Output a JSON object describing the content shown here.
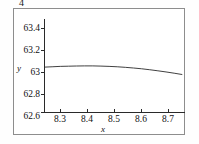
{
  "figure": {
    "number": "4",
    "frame_border_color": "#8d8d8d",
    "background": "#ffffff"
  },
  "chart_data": {
    "type": "line",
    "title": "",
    "subtitle": "",
    "xlabel": "x",
    "ylabel": "y",
    "xlim": [
      8.24,
      8.76
    ],
    "ylim": [
      62.52,
      63.5
    ],
    "xticks": [
      "8.3",
      "8.4",
      "8.5",
      "8.6",
      "8.7"
    ],
    "xtick_values": [
      8.3,
      8.4,
      8.5,
      8.6,
      8.7
    ],
    "yticks": [
      "63.4",
      "63.2",
      "63",
      "62.8",
      "62.6"
    ],
    "ytick_values": [
      63.4,
      63.2,
      63.0,
      62.8,
      62.6
    ],
    "grid": false,
    "legend": null,
    "line_color": "#2a2a2a",
    "series": [
      {
        "name": "curve",
        "x": [
          8.24,
          8.27,
          8.3,
          8.33,
          8.36,
          8.39,
          8.42,
          8.45,
          8.48,
          8.51,
          8.54,
          8.57,
          8.6,
          8.63,
          8.66,
          8.69,
          8.72,
          8.75
        ],
        "y": [
          62.998,
          63.002,
          63.006,
          63.008,
          63.01,
          63.011,
          63.011,
          63.009,
          63.006,
          63.002,
          62.996,
          62.989,
          62.981,
          62.971,
          62.96,
          62.948,
          62.935,
          62.921
        ]
      }
    ]
  }
}
